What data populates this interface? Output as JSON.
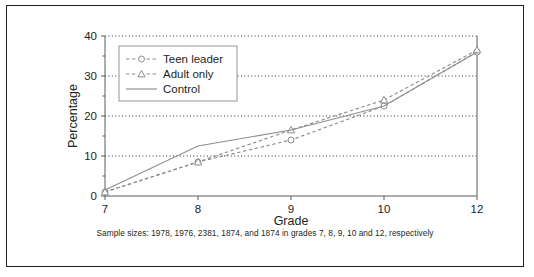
{
  "figure": {
    "caption": "Sample sizes: 1978, 1976, 2381, 1874, and 1874 in grades 7, 8, 9, 10 and 12, respectively"
  },
  "colors": {
    "line": "#8e8e8e",
    "axis": "#5b5b5b",
    "grid": "#1a1a1a",
    "text": "#231f20",
    "frame": "#231f20",
    "marker_fill": "#ffffff",
    "legend_border": "#8a8a8a",
    "background": "#ffffff"
  },
  "chart_data": {
    "type": "line",
    "title": "",
    "xlabel": "Grade",
    "ylabel": "Percentage",
    "categories": [
      "7",
      "8",
      "9",
      "10",
      "12"
    ],
    "x_tick_labels": [
      "7",
      "8",
      "9",
      "10",
      "12"
    ],
    "y_tick_labels": [
      "0",
      "10",
      "20",
      "30",
      "40"
    ],
    "y_ticks": [
      0,
      10,
      20,
      30,
      40
    ],
    "y_minor_ticks": [
      5,
      15,
      25,
      35
    ],
    "ylim": [
      0,
      40
    ],
    "grid": "horizontal-dotted-at-10-20-30-40",
    "legend_position": "top-left-inside",
    "series": [
      {
        "name": "Teen leader",
        "values": [
          1,
          8.5,
          14,
          22.5,
          36
        ],
        "marker": "circle",
        "linestyle": "dashed"
      },
      {
        "name": "Adult only",
        "values": [
          1,
          8.5,
          16.5,
          24,
          36.5
        ],
        "marker": "triangle",
        "linestyle": "dashed"
      },
      {
        "name": "Control",
        "values": [
          1.5,
          12.5,
          16.5,
          22.5,
          36
        ],
        "marker": "none",
        "linestyle": "solid"
      }
    ]
  },
  "legend": {
    "items": [
      {
        "label": "Teen leader",
        "marker": "circle-marker",
        "style": "dashed"
      },
      {
        "label": "Adult only",
        "marker": "triangle-marker",
        "style": "dashed"
      },
      {
        "label": "Control",
        "marker": "none",
        "style": "solid"
      }
    ]
  }
}
